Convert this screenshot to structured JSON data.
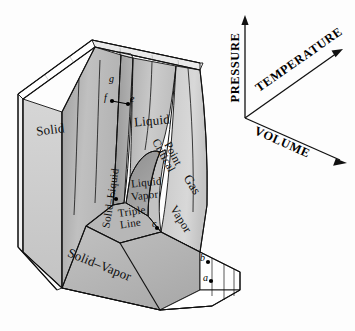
{
  "figure": {
    "kind": "pvt-surface-diagram",
    "background": "#fdfdfd",
    "line_color": "#111111"
  },
  "axes": {
    "pressure": {
      "label": "PRESSURE",
      "direction": "up"
    },
    "temperature": {
      "label": "TEMPERATURE",
      "direction": "up-right"
    },
    "volume": {
      "label": "VOLUME",
      "direction": "down-right"
    }
  },
  "regions": [
    {
      "id": "solid",
      "label": "Solid",
      "fill": "#b9b9b9"
    },
    {
      "id": "solid-liquid",
      "label": "Solid–Liquid",
      "fill": "#a6a6a6"
    },
    {
      "id": "liquid",
      "label": "Liquid",
      "fill": "#c2c2c2"
    },
    {
      "id": "liquid-vapor",
      "label": "Liquid\nVapor",
      "fill": "#9a9a9a"
    },
    {
      "id": "triple-line",
      "label": "Triple\nLine",
      "fill": "#b0b0b0"
    },
    {
      "id": "gas",
      "label": "Gas",
      "fill": "#cecece"
    },
    {
      "id": "vapor",
      "label": "Vapor",
      "fill": "#c6c6c6"
    },
    {
      "id": "solid-vapor",
      "label": "Solid–Vapor",
      "fill": "#b4b4b4"
    },
    {
      "id": "critical-point",
      "label": "Critical\nPoint",
      "fill": "none"
    }
  ],
  "labels": {
    "solid": "Solid",
    "solid_liquid": "Solid–Liquid",
    "liquid": "Liquid",
    "liquid_vapor_1": "Liquid",
    "liquid_vapor_2": "Vapor",
    "triple_1": "Triple",
    "triple_2": "Line",
    "gas": "Gas",
    "vapor": "Vapor",
    "solid_vapor": "Solid–Vapor",
    "critical_1": "Critical",
    "critical_2": "Point"
  },
  "points": [
    {
      "id": "a",
      "label": "a",
      "marker": true
    },
    {
      "id": "b",
      "label": "b",
      "marker": true
    },
    {
      "id": "c",
      "label": "c",
      "marker": true
    },
    {
      "id": "d",
      "label": "d",
      "marker": true
    },
    {
      "id": "e",
      "label": "e",
      "marker": true
    },
    {
      "id": "f",
      "label": "f",
      "marker": true
    },
    {
      "id": "g",
      "label": "g",
      "marker": false
    }
  ]
}
